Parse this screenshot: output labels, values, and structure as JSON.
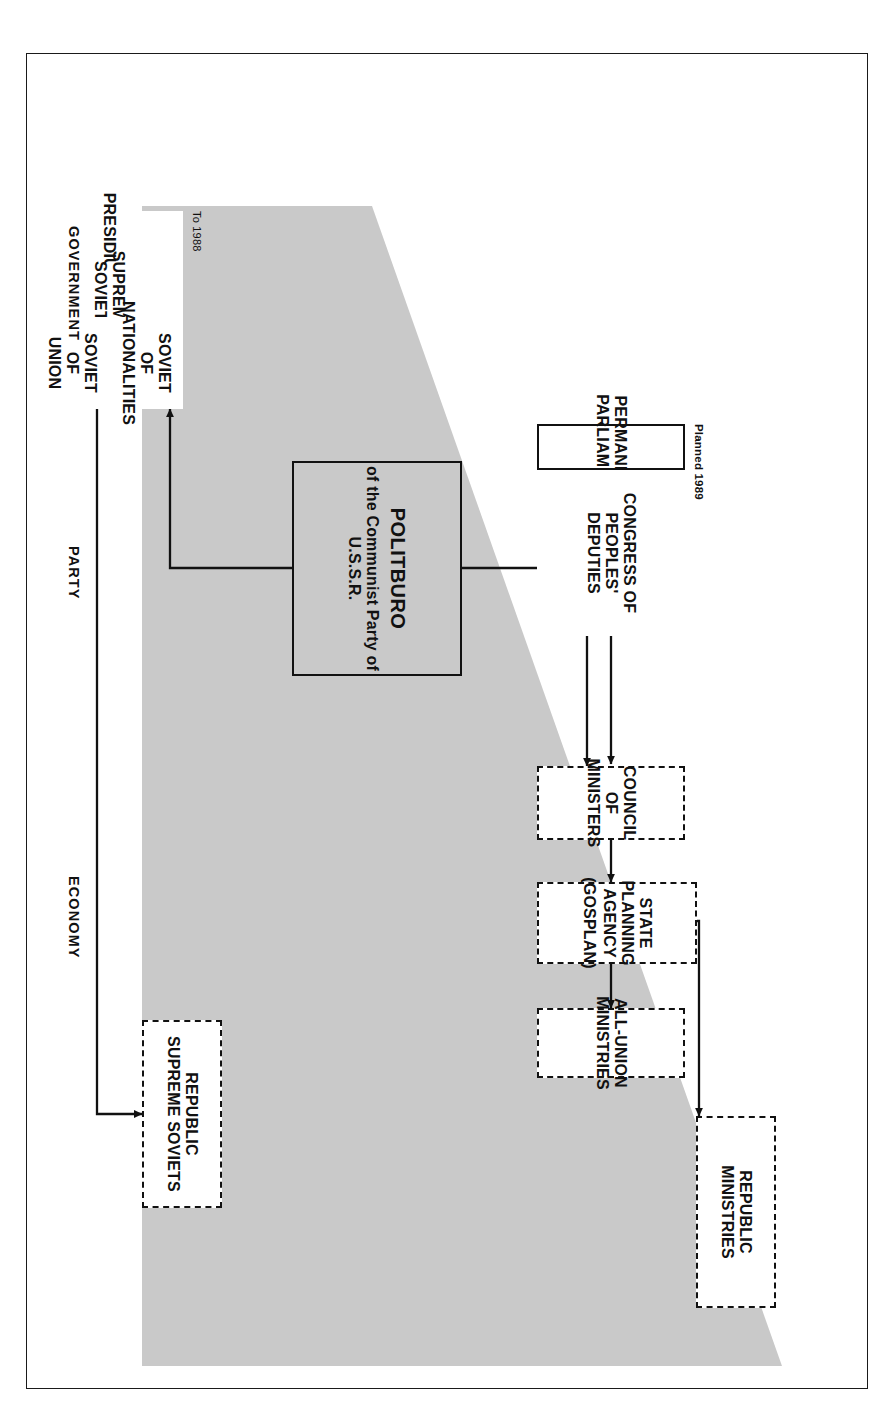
{
  "diagram": {
    "colors": {
      "wedge_gray": "#c9c9c9",
      "politburo_fill": "#c9c9c9",
      "line": "#111111",
      "page_background": "#ffffff"
    },
    "column_labels": [
      {
        "id": "government",
        "text": "GOVERNMENT"
      },
      {
        "id": "party",
        "text": "PARTY"
      },
      {
        "id": "economy",
        "text": "ECONOMY"
      }
    ],
    "annotations": [
      {
        "id": "to-1988",
        "text": "To 1988"
      },
      {
        "id": "planned-1989",
        "text": "Planned 1989"
      }
    ],
    "boxes": {
      "politburo": {
        "line1": "POLITBURO",
        "line2": "of the Communist Party of U.S.S.R."
      },
      "council_of_ministers": {
        "line1": "COUNCIL OF MINISTERS"
      },
      "state_planning_agency": {
        "line1": "STATE PLANNING AGENCY",
        "line2": "(GOSPLAN)"
      },
      "all_union_ministries": {
        "line1": "ALL-UNION MINISTRIES"
      },
      "republic_ministries": {
        "line1": "REPUBLIC",
        "line2": "MINISTRIES"
      },
      "permanent_parliament": {
        "line1": "PERMANENT PARLIAMENT"
      },
      "congress_of_peoples_deputies": {
        "line1": "CONGRESS OF",
        "line2": "PEOPLES' DEPUTIES"
      },
      "presidium": {
        "line1": "PRESIDIUM"
      },
      "supreme_soviet": {
        "line1": "SUPREME SOVIET"
      },
      "soviet_of_union": {
        "line1": "SOVIET",
        "line2": "OF",
        "line3": "UNION"
      },
      "soviet_of_nationalities": {
        "line1": "SOVIET",
        "line2": "OF",
        "line3": "NATIONALITIES"
      },
      "republic_supreme_soviets": {
        "line1": "REPUBLIC",
        "line2": "SUPREME SOVIETS"
      }
    }
  }
}
